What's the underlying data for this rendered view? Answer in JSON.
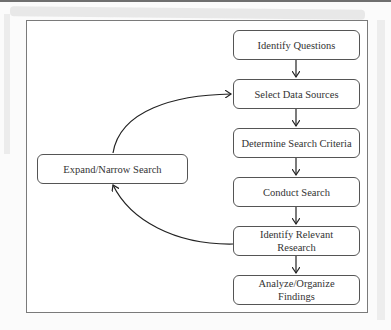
{
  "diagram": {
    "steps": [
      {
        "label": "Identify Questions"
      },
      {
        "label": "Select Data Sources"
      },
      {
        "label": "Determine Search Criteria"
      },
      {
        "label": "Conduct Search"
      },
      {
        "label": "Identify Relevant Research"
      },
      {
        "label": "Analyze/Organize Findings"
      }
    ],
    "loop": {
      "label": "Expand/Narrow Search"
    }
  }
}
